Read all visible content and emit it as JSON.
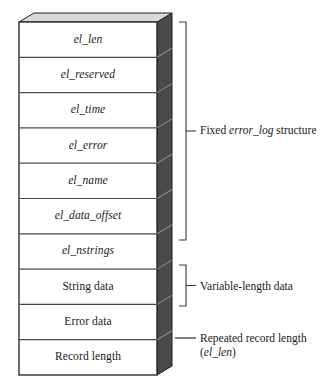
{
  "diagram": {
    "colors": {
      "face": "#ffffff",
      "side_face": "#4a4a4a",
      "top_face": "#d8d8d8",
      "outline": "#1f1f1f",
      "divider": "#4a4a4a",
      "bracket": "#3a3a3a",
      "text": "#1a1a1a",
      "background": "#ffffff"
    },
    "geometry": {
      "block_left": 19,
      "block_right": 157,
      "block_top": 22,
      "block_bottom": 375,
      "depth_x": 15,
      "depth_y": -9,
      "row_count": 10
    },
    "rows": [
      {
        "label": "el_len",
        "style": "italic",
        "group": "fixed"
      },
      {
        "label": "el_reserved",
        "style": "italic",
        "group": "fixed"
      },
      {
        "label": "el_time",
        "style": "italic",
        "group": "fixed"
      },
      {
        "label": "el_error",
        "style": "italic",
        "group": "fixed"
      },
      {
        "label": "el_name",
        "style": "italic",
        "group": "fixed"
      },
      {
        "label": "el_data_offset",
        "style": "italic",
        "group": "fixed"
      },
      {
        "label": "el_nstrings",
        "style": "italic",
        "group": "fixed"
      },
      {
        "label": "String data",
        "style": "roman",
        "group": "variable"
      },
      {
        "label": "Error data",
        "style": "roman",
        "group": "variable"
      },
      {
        "label": "Record length",
        "style": "roman",
        "group": "repeated"
      }
    ],
    "annotations": [
      {
        "id": "fixed-structure",
        "marker": "bracket",
        "text_before": "Fixed ",
        "text_italic": "error_log",
        "text_after": " structure",
        "second_line": "",
        "second_line_italic": "",
        "span_top": 22,
        "span_bottom": 240,
        "label_y": 124
      },
      {
        "id": "variable-length-data",
        "marker": "bracket",
        "text_before": "Variable-length data",
        "text_italic": "",
        "text_after": "",
        "second_line": "",
        "second_line_italic": "",
        "span_top": 265,
        "span_bottom": 306,
        "label_y": 280
      },
      {
        "id": "repeated-record-length",
        "marker": "dash",
        "text_before": "Repeated record length",
        "text_italic": "",
        "text_after": "",
        "second_line_prefix": "(",
        "second_line_italic": "el_len",
        "second_line_suffix": ")",
        "span_top": 338,
        "span_bottom": 338,
        "label_y": 332
      }
    ]
  }
}
